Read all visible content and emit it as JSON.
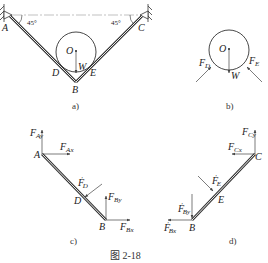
{
  "figure": {
    "caption": "图   2-18",
    "panels": [
      {
        "id": "a",
        "caption": "a)"
      },
      {
        "id": "b",
        "caption": "b)"
      },
      {
        "id": "c",
        "caption": "c)"
      },
      {
        "id": "d",
        "caption": "d)"
      }
    ]
  },
  "panel_a": {
    "points": {
      "A": "A",
      "B": "B",
      "C": "C",
      "D": "D",
      "E": "E",
      "O": "O"
    },
    "weight": "W",
    "angle_left": "45°",
    "angle_right": "45°"
  },
  "panel_b": {
    "center": "O",
    "weight": "W",
    "force_D": {
      "main": "F",
      "sub": "D"
    },
    "force_E": {
      "main": "F",
      "sub": "E"
    }
  },
  "panel_c": {
    "points": {
      "A": "A",
      "B": "B",
      "D": "D"
    },
    "forces": {
      "FAy": {
        "main": "F",
        "sub": "Ay"
      },
      "FAx": {
        "main": "F",
        "sub": "Ax"
      },
      "FD": {
        "main": "F",
        "sub": "D",
        "prime": "′"
      },
      "FBy": {
        "main": "F",
        "sub": "By"
      },
      "FBx": {
        "main": "F",
        "sub": "Bx"
      }
    }
  },
  "panel_d": {
    "points": {
      "B": "B",
      "C": "C",
      "E": "E"
    },
    "forces": {
      "FCy": {
        "main": "F",
        "sub": "Cy"
      },
      "FCx": {
        "main": "F",
        "sub": "Cx"
      },
      "FE": {
        "main": "F",
        "sub": "E",
        "prime": "′"
      },
      "FBy": {
        "main": "F",
        "sub": "By",
        "prime": "′"
      },
      "FBx": {
        "main": "F",
        "sub": "Bx",
        "prime": "′"
      }
    }
  }
}
